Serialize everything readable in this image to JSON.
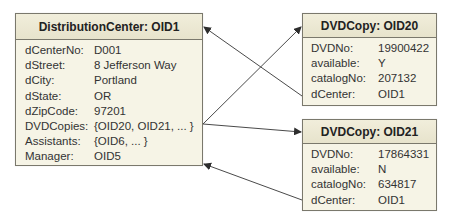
{
  "distribution_center": {
    "title": "DistributionCenter: OID1",
    "attributes": [
      {
        "key": "dCenterNo:",
        "value": "D001"
      },
      {
        "key": "dStreet:",
        "value": "8 Jefferson Way"
      },
      {
        "key": "dCity:",
        "value": "Portland"
      },
      {
        "key": "dState:",
        "value": "OR"
      },
      {
        "key": "dZipCode:",
        "value": "97201"
      },
      {
        "key": "DVDCopies:",
        "value": "{OID20, OID21, ... }"
      },
      {
        "key": "Assistants:",
        "value": "{OID6, ... }"
      },
      {
        "key": "Manager:",
        "value": "OID5"
      }
    ]
  },
  "dvd_copy_20": {
    "title": "DVDCopy: OID20",
    "attributes": [
      {
        "key": "DVDNo:",
        "value": "19900422"
      },
      {
        "key": "available:",
        "value": "Y"
      },
      {
        "key": "catalogNo:",
        "value": "207132"
      },
      {
        "key": "dCenter:",
        "value": "OID1"
      }
    ]
  },
  "dvd_copy_21": {
    "title": "DVDCopy: OID21",
    "attributes": [
      {
        "key": "DVDNo:",
        "value": "17864331"
      },
      {
        "key": "available:",
        "value": "N"
      },
      {
        "key": "catalogNo:",
        "value": "634817"
      },
      {
        "key": "dCenter:",
        "value": "OID1"
      }
    ]
  },
  "links": [
    {
      "from": "DistributionCenter.DVDCopies",
      "to": "DVDCopy: OID20"
    },
    {
      "from": "DistributionCenter.DVDCopies",
      "to": "DVDCopy: OID21"
    },
    {
      "from": "DVDCopy: OID20.dCenter",
      "to": "DistributionCenter: OID1"
    },
    {
      "from": "DVDCopy: OID21.dCenter",
      "to": "DistributionCenter: OID1"
    }
  ],
  "colors": {
    "border": "#7a786c",
    "header_bg": "#ece8d4",
    "body_bg": "#f6f4e6",
    "arrow": "#3a3a3a"
  }
}
